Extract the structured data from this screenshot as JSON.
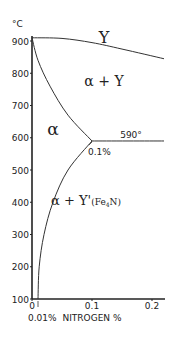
{
  "chart_data": {
    "type": "phase-diagram",
    "title": "",
    "xlabel": "NITROGEN %",
    "ylabel": "°C",
    "xlim": [
      0,
      0.22
    ],
    "ylim": [
      100,
      930
    ],
    "x_ticks": [
      "0",
      "0.1",
      "0.2"
    ],
    "y_ticks": [
      "100",
      "200",
      "300",
      "400",
      "500",
      "600",
      "700",
      "800",
      "900"
    ],
    "x_tick_values": [
      0,
      0.1,
      0.2
    ],
    "y_tick_values": [
      100,
      200,
      300,
      400,
      500,
      600,
      700,
      800,
      900
    ],
    "boundaries": [
      {
        "name": "gamma-upper",
        "points": [
          [
            0,
            910
          ],
          [
            0.05,
            908
          ],
          [
            0.1,
            895
          ],
          [
            0.15,
            875
          ],
          [
            0.22,
            845
          ]
        ]
      },
      {
        "name": "alpha-gamma",
        "points": [
          [
            0,
            910
          ],
          [
            0.01,
            840
          ],
          [
            0.03,
            760
          ],
          [
            0.06,
            670
          ],
          [
            0.1,
            590
          ]
        ]
      },
      {
        "name": "eutectoid",
        "points": [
          [
            0.1,
            590
          ],
          [
            0.22,
            590
          ]
        ]
      },
      {
        "name": "alpha-solvus",
        "points": [
          [
            0.1,
            590
          ],
          [
            0.06,
            500
          ],
          [
            0.035,
            400
          ],
          [
            0.02,
            300
          ],
          [
            0.012,
            200
          ],
          [
            0.01,
            100
          ]
        ]
      }
    ],
    "regions": [
      {
        "label": "Y",
        "x": 0.12,
        "y": 895
      },
      {
        "label": "α + Y",
        "x": 0.12,
        "y": 760
      },
      {
        "label": "α",
        "x": 0.035,
        "y": 610
      },
      {
        "label": "α + Y'(Fe4N)",
        "x": 0.09,
        "y": 390
      }
    ],
    "annotations": [
      {
        "text": "590°",
        "x": 0.165,
        "y": 598
      },
      {
        "text": "0.1%",
        "x": 0.1,
        "y": 570
      },
      {
        "text": "0.01%",
        "x": 0.01,
        "y": 65
      }
    ]
  }
}
